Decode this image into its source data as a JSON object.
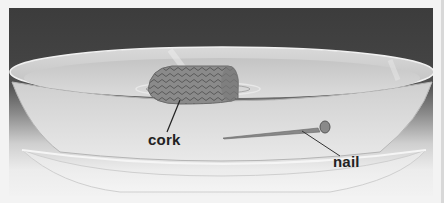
{
  "figure": {
    "labels": {
      "cork": "cork",
      "nail": "nail"
    },
    "colors": {
      "background_top": "#3c3c3c",
      "background_bottom": "#f2f2f2",
      "frame_border": "#f3f3f3",
      "label_text": "#222222"
    }
  }
}
